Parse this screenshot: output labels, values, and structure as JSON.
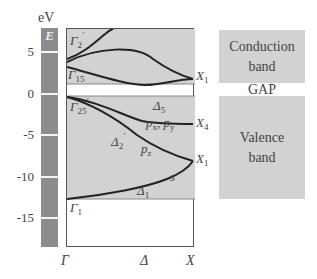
{
  "energy_axis": {
    "unit": "eV",
    "bar_label": "E",
    "ticks": [
      "5",
      "0",
      "-5",
      "-10",
      "-15"
    ]
  },
  "plot": {
    "x_axis_labels": [
      "Γ",
      "Δ",
      "X"
    ],
    "region_colors": {
      "band": "#d2d2d2",
      "gap": "#ffffff",
      "curve": "#222222",
      "ebar": "#8c8c8c"
    },
    "point_labels": {
      "gamma2p": "Γ",
      "gamma2p_sub": "2",
      "gamma15": "Γ",
      "gamma15_sub": "15",
      "gamma25p": "Γ",
      "gamma25p_sub": "25",
      "gamma1": "Γ",
      "gamma1_sub": "1",
      "x1_top": "X",
      "x1_top_sub": "1",
      "x4": "X",
      "x4_sub": "4",
      "x1_mid": "X",
      "x1_mid_sub": "1"
    },
    "branch_labels": {
      "delta5": "Δ",
      "delta5_sub": "5",
      "delta2p": "Δ",
      "delta2p_sub": "2",
      "delta1": "Δ",
      "delta1_sub": "1",
      "pxpy": "p",
      "pxpy_x": "x",
      "pxpy_sep": ", p",
      "pxpy_y": "y",
      "pz": "p",
      "pz_sub": "z",
      "s": "s"
    }
  },
  "legend": {
    "conduction": [
      "Conduction",
      "band"
    ],
    "gap": "GAP",
    "valence": [
      "Valence",
      "band"
    ]
  }
}
